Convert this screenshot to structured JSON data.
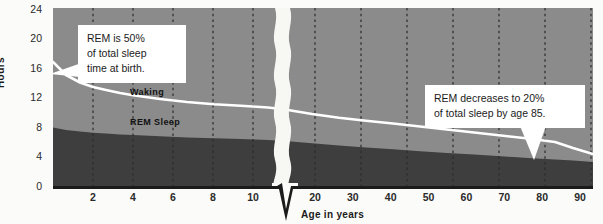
{
  "chart_data": {
    "type": "area",
    "title": "",
    "xlabel": "Age in years",
    "ylabel": "Hours",
    "ylim": [
      0,
      24
    ],
    "yticks": [
      0,
      4,
      8,
      12,
      16,
      20,
      24
    ],
    "xticks_left": [
      2,
      4,
      6,
      8,
      10
    ],
    "xticks_right": [
      20,
      30,
      40,
      50,
      60,
      70,
      80,
      90
    ],
    "axis_break": true,
    "axis_break_between": [
      14,
      16
    ],
    "grid": "vertical dashed",
    "legend": "inline",
    "series": [
      {
        "name": "REM Sleep",
        "note": "lower dark band: hours of REM sleep",
        "x": [
          0,
          1,
          2,
          3,
          4,
          5,
          6,
          8,
          10,
          12,
          14,
          16,
          20,
          30,
          40,
          50,
          60,
          70,
          80,
          85,
          90
        ],
        "values": [
          8.0,
          7.7,
          7.5,
          7.4,
          7.3,
          7.2,
          7.1,
          7.0,
          6.8,
          6.6,
          6.5,
          6.3,
          6.1,
          5.8,
          5.6,
          5.4,
          5.2,
          5.0,
          4.8,
          4.6,
          4.4
        ]
      },
      {
        "name": "Waking",
        "note": "white line = total sleep time; area above it is waking",
        "x": [
          0,
          1,
          2,
          3,
          4,
          5,
          6,
          8,
          10,
          12,
          14,
          16,
          20,
          30,
          40,
          50,
          60,
          70,
          80,
          85,
          90
        ],
        "values": [
          16.0,
          14.2,
          13.2,
          12.6,
          12.2,
          11.8,
          11.5,
          11.0,
          10.6,
          10.3,
          10.1,
          9.9,
          9.6,
          9.0,
          8.5,
          8.1,
          7.8,
          7.4,
          7.0,
          6.2,
          5.5
        ]
      }
    ],
    "annotations": [
      {
        "id": "left",
        "text": "REM is 50% of total sleep time at birth.",
        "points_to": "age 0"
      },
      {
        "id": "right",
        "text": "REM decreases to 20% of total sleep by age 85.",
        "points_to": "age 85"
      }
    ],
    "colors": {
      "waking_area": "#8b8b8b",
      "rem_area": "#3e3e3e",
      "line": "#ffffff",
      "axis": "#1b1b1b",
      "gridline": "#2b2b2b",
      "callout_bg": "#ffffff",
      "page_bg": "#fbfbf9"
    }
  },
  "axis": {
    "y_title": "Hours",
    "x_title": "Age in years",
    "y_ticks": [
      "24",
      "20",
      "16",
      "12",
      "8",
      "4",
      "0"
    ],
    "x_ticks_left": [
      "2",
      "4",
      "6",
      "8",
      "10"
    ],
    "x_ticks_right": [
      "20",
      "30",
      "40",
      "50",
      "60",
      "70",
      "80",
      "90"
    ]
  },
  "series_labels": {
    "waking": "Waking",
    "rem": "REM Sleep"
  },
  "callouts": {
    "left": {
      "line1": "REM is 50%",
      "line2": "of total sleep",
      "line3": "time at birth."
    },
    "right": {
      "line1": "REM decreases to 20%",
      "line2": "of total sleep by age 85."
    }
  }
}
